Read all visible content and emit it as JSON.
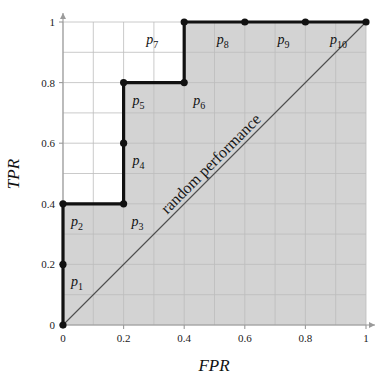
{
  "chart_data": {
    "type": "line",
    "title": "",
    "subtitle": "",
    "xlabel": "FPR",
    "ylabel": "TPR",
    "xlim": [
      0,
      1
    ],
    "ylim": [
      0,
      1
    ],
    "xticks": [
      "0",
      "0.2",
      "0.4",
      "0.6",
      "0.8",
      "1"
    ],
    "xtick_values": [
      0,
      0.2,
      0.4,
      0.6,
      0.8,
      1
    ],
    "yticks": [
      "0",
      "0.2",
      "0.4",
      "0.6",
      "0.8",
      "1"
    ],
    "ytick_values": [
      0,
      0.2,
      0.4,
      0.6,
      0.8,
      1
    ],
    "grid": true,
    "grid_step": 0.1,
    "legend": "none",
    "series": [
      {
        "name": "ROC curve",
        "x": [
          0,
          0,
          0,
          0.2,
          0.2,
          0.2,
          0.4,
          0.4,
          0.6,
          0.8,
          1
        ],
        "y": [
          0,
          0.2,
          0.4,
          0.4,
          0.6,
          0.8,
          0.8,
          1,
          1,
          1,
          1
        ],
        "color": "#111111",
        "style": "step-markers"
      },
      {
        "name": "random performance",
        "x": [
          0,
          1
        ],
        "y": [
          0,
          1
        ],
        "color": "#4d4d4d",
        "style": "thin-line"
      }
    ],
    "points": [
      {
        "label": "p",
        "index": "1",
        "x": 0,
        "y": 0.2,
        "label_dx": 8,
        "label_dy": 22
      },
      {
        "label": "p",
        "index": "2",
        "x": 0,
        "y": 0.4,
        "label_dx": 8,
        "label_dy": 22
      },
      {
        "label": "p",
        "index": "3",
        "x": 0.2,
        "y": 0.4,
        "label_dx": 8,
        "label_dy": 22
      },
      {
        "label": "p",
        "index": "4",
        "x": 0.2,
        "y": 0.6,
        "label_dx": 9,
        "label_dy": 22
      },
      {
        "label": "p",
        "index": "5",
        "x": 0.2,
        "y": 0.8,
        "label_dx": 9,
        "label_dy": 22
      },
      {
        "label": "p",
        "index": "6",
        "x": 0.4,
        "y": 0.8,
        "label_dx": 9,
        "label_dy": 22
      },
      {
        "label": "p",
        "index": "7",
        "x": 0.4,
        "y": 1,
        "label_dx": -38,
        "label_dy": 22
      },
      {
        "label": "p",
        "index": "8",
        "x": 0.6,
        "y": 1,
        "label_dx": -28,
        "label_dy": 22
      },
      {
        "label": "p",
        "index": "9",
        "x": 0.8,
        "y": 1,
        "label_dx": -28,
        "label_dy": 22
      },
      {
        "label": "p",
        "index": "10",
        "x": 1,
        "y": 1,
        "label_dx": -36,
        "label_dy": 22
      }
    ],
    "annotations": [
      {
        "text": "random performance",
        "x": 0.5,
        "y": 0.5,
        "rotation": -45,
        "placement": "along-diagonal"
      }
    ],
    "shaded_region": {
      "name": "area-under-curve",
      "color": "#d3d3d3",
      "description": "area under the ROC step curve"
    }
  },
  "axes": {
    "x_title": "FPR",
    "y_title": "TPR"
  },
  "colors": {
    "curve": "#111111",
    "diagonal": "#4d4d4d",
    "grid": "#bdbdbd",
    "axis": "#9a9a9a",
    "fill": "#d3d3d3",
    "background": "#ffffff",
    "text": "#111111"
  }
}
